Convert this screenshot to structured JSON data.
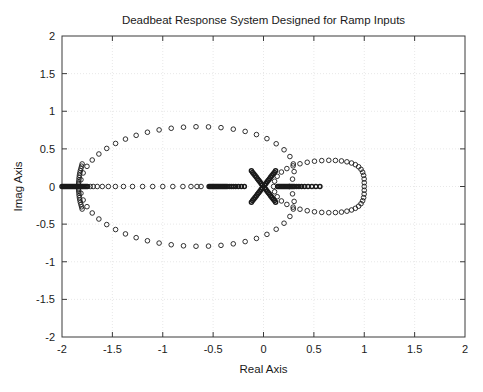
{
  "figure": {
    "title": "Deadbeat Response System Designed for Ramp Inputs",
    "background_color": "#ffffff",
    "axes_color": "#3a3a3a",
    "grid_color": "#e2e2e2",
    "marker_color": "#1a1a1a",
    "text_color": "#1a1a1a"
  },
  "chart_data": {
    "type": "scatter",
    "title": "Deadbeat Response System Designed for Ramp Inputs",
    "xlabel": "Real Axis",
    "ylabel": "Imag Axis",
    "xlim": [
      -2,
      2
    ],
    "ylim": [
      -2,
      2
    ],
    "grid": true,
    "legend": "none",
    "marker": "open-circle",
    "xticks": [
      -2,
      -1.5,
      -1,
      -0.5,
      0,
      0.5,
      1,
      1.5,
      2
    ],
    "yticks": [
      -2,
      -1.5,
      -1,
      -0.5,
      0,
      0.5,
      1,
      1.5,
      2
    ],
    "xtick_labels": [
      "-2",
      "-1.5",
      "-1",
      "-0.5",
      "0",
      "0.5",
      "1",
      "1.5",
      "2"
    ],
    "ytick_labels": [
      "-2",
      "-1.5",
      "-1",
      "-0.5",
      "0",
      "0.5",
      "1",
      "1.5",
      "2"
    ],
    "series": [
      {
        "name": "large-oval-branch",
        "comment": "Big closed oval from Real -1.82 to +0.30, max |Imag| ~ 0.80",
        "points": [
          [
            -1.82,
            0.0
          ],
          [
            -1.812,
            0.09
          ],
          [
            -1.79,
            0.18
          ],
          [
            -1.752,
            0.268
          ],
          [
            -1.7,
            0.352
          ],
          [
            -1.634,
            0.432
          ],
          [
            -1.556,
            0.506
          ],
          [
            -1.468,
            0.572
          ],
          [
            -1.37,
            0.63
          ],
          [
            -1.264,
            0.68
          ],
          [
            -1.152,
            0.721
          ],
          [
            -1.036,
            0.752
          ],
          [
            -0.916,
            0.774
          ],
          [
            -0.794,
            0.788
          ],
          [
            -0.67,
            0.794
          ],
          [
            -0.546,
            0.792
          ],
          [
            -0.422,
            0.782
          ],
          [
            -0.3,
            0.762
          ],
          [
            -0.182,
            0.732
          ],
          [
            -0.07,
            0.69
          ],
          [
            0.034,
            0.636
          ],
          [
            0.126,
            0.568
          ],
          [
            0.204,
            0.488
          ],
          [
            0.262,
            0.398
          ],
          [
            0.296,
            0.3
          ],
          [
            0.304,
            0.198
          ],
          [
            0.288,
            0.098
          ],
          [
            0.256,
            0.0
          ],
          [
            0.288,
            -0.098
          ],
          [
            0.304,
            -0.198
          ],
          [
            0.296,
            -0.3
          ],
          [
            0.262,
            -0.398
          ],
          [
            0.204,
            -0.488
          ],
          [
            0.126,
            -0.568
          ],
          [
            0.034,
            -0.636
          ],
          [
            -0.07,
            -0.69
          ],
          [
            -0.182,
            -0.732
          ],
          [
            -0.3,
            -0.762
          ],
          [
            -0.422,
            -0.782
          ],
          [
            -0.546,
            -0.792
          ],
          [
            -0.67,
            -0.794
          ],
          [
            -0.794,
            -0.788
          ],
          [
            -0.916,
            -0.774
          ],
          [
            -1.036,
            -0.752
          ],
          [
            -1.152,
            -0.721
          ],
          [
            -1.264,
            -0.68
          ],
          [
            -1.37,
            -0.63
          ],
          [
            -1.468,
            -0.572
          ],
          [
            -1.556,
            -0.506
          ],
          [
            -1.634,
            -0.432
          ],
          [
            -1.7,
            -0.352
          ],
          [
            -1.752,
            -0.268
          ],
          [
            -1.79,
            -0.18
          ],
          [
            -1.812,
            -0.09
          ]
        ]
      },
      {
        "name": "right-oval-branch",
        "comment": "Smaller oval from Real +0.10 to +1.00, max |Imag| ~ 0.36",
        "points": [
          [
            0.1,
            0.0
          ],
          [
            0.11,
            0.07
          ],
          [
            0.136,
            0.136
          ],
          [
            0.178,
            0.192
          ],
          [
            0.232,
            0.238
          ],
          [
            0.294,
            0.274
          ],
          [
            0.362,
            0.302
          ],
          [
            0.434,
            0.322
          ],
          [
            0.506,
            0.336
          ],
          [
            0.578,
            0.344
          ],
          [
            0.648,
            0.348
          ],
          [
            0.714,
            0.346
          ],
          [
            0.774,
            0.34
          ],
          [
            0.828,
            0.328
          ],
          [
            0.874,
            0.312
          ],
          [
            0.912,
            0.29
          ],
          [
            0.944,
            0.262
          ],
          [
            0.968,
            0.228
          ],
          [
            0.984,
            0.19
          ],
          [
            0.994,
            0.148
          ],
          [
            0.999,
            0.1
          ],
          [
            1.0,
            0.05
          ],
          [
            1.0,
            0.0
          ],
          [
            1.0,
            -0.05
          ],
          [
            0.999,
            -0.1
          ],
          [
            0.994,
            -0.148
          ],
          [
            0.984,
            -0.19
          ],
          [
            0.968,
            -0.228
          ],
          [
            0.944,
            -0.262
          ],
          [
            0.912,
            -0.29
          ],
          [
            0.874,
            -0.312
          ],
          [
            0.828,
            -0.328
          ],
          [
            0.774,
            -0.34
          ],
          [
            0.714,
            -0.346
          ],
          [
            0.648,
            -0.348
          ],
          [
            0.578,
            -0.344
          ],
          [
            0.506,
            -0.336
          ],
          [
            0.434,
            -0.322
          ],
          [
            0.362,
            -0.302
          ],
          [
            0.294,
            -0.274
          ],
          [
            0.232,
            -0.238
          ],
          [
            0.178,
            -0.192
          ],
          [
            0.136,
            -0.136
          ],
          [
            0.11,
            -0.07
          ]
        ]
      },
      {
        "name": "origin-star-rays",
        "comment": "Six dense rays emanating from the origin at 0, 60, 120, 180, 240, 300 degrees",
        "points": [
          [
            0.012,
            0.02
          ],
          [
            0.024,
            0.041
          ],
          [
            0.036,
            0.062
          ],
          [
            0.048,
            0.083
          ],
          [
            0.06,
            0.104
          ],
          [
            0.072,
            0.125
          ],
          [
            0.084,
            0.145
          ],
          [
            0.096,
            0.166
          ],
          [
            0.108,
            0.187
          ],
          [
            0.12,
            0.208
          ],
          [
            -0.012,
            0.02
          ],
          [
            -0.024,
            0.041
          ],
          [
            -0.036,
            0.062
          ],
          [
            -0.048,
            0.083
          ],
          [
            -0.06,
            0.104
          ],
          [
            -0.072,
            0.125
          ],
          [
            -0.084,
            0.145
          ],
          [
            -0.096,
            0.166
          ],
          [
            -0.108,
            0.187
          ],
          [
            -0.12,
            0.208
          ],
          [
            0.012,
            -0.02
          ],
          [
            0.024,
            -0.041
          ],
          [
            0.036,
            -0.062
          ],
          [
            0.048,
            -0.083
          ],
          [
            0.06,
            -0.104
          ],
          [
            0.072,
            -0.125
          ],
          [
            0.084,
            -0.145
          ],
          [
            0.096,
            -0.166
          ],
          [
            0.108,
            -0.187
          ],
          [
            0.12,
            -0.208
          ],
          [
            -0.012,
            -0.02
          ],
          [
            -0.024,
            -0.041
          ],
          [
            -0.036,
            -0.062
          ],
          [
            -0.048,
            -0.083
          ],
          [
            -0.06,
            -0.104
          ],
          [
            -0.072,
            -0.125
          ],
          [
            -0.084,
            -0.145
          ],
          [
            -0.096,
            -0.166
          ],
          [
            -0.108,
            -0.187
          ],
          [
            -0.12,
            -0.208
          ]
        ]
      },
      {
        "name": "left-vertical-arc",
        "comment": "Vertical arc centred near Real -1.80, Imag -0.30 to +0.30",
        "points": [
          [
            -1.8,
            0.3
          ],
          [
            -1.806,
            0.27
          ],
          [
            -1.812,
            0.24
          ],
          [
            -1.818,
            0.21
          ],
          [
            -1.823,
            0.18
          ],
          [
            -1.827,
            0.15
          ],
          [
            -1.83,
            0.12
          ],
          [
            -1.832,
            0.09
          ],
          [
            -1.834,
            0.06
          ],
          [
            -1.835,
            0.03
          ],
          [
            -1.835,
            0.0
          ],
          [
            -1.835,
            -0.03
          ],
          [
            -1.834,
            -0.06
          ],
          [
            -1.832,
            -0.09
          ],
          [
            -1.83,
            -0.12
          ],
          [
            -1.827,
            -0.15
          ],
          [
            -1.823,
            -0.18
          ],
          [
            -1.818,
            -0.21
          ],
          [
            -1.812,
            -0.24
          ],
          [
            -1.806,
            -0.27
          ],
          [
            -1.8,
            -0.3
          ]
        ]
      },
      {
        "name": "real-axis-left-dense",
        "comment": "Dense cluster on the real axis from -2.00 to -1.74",
        "points": [
          [
            -2.0,
            0.0
          ],
          [
            -1.988,
            0.0
          ],
          [
            -1.976,
            0.0
          ],
          [
            -1.964,
            0.0
          ],
          [
            -1.952,
            0.0
          ],
          [
            -1.94,
            0.0
          ],
          [
            -1.928,
            0.0
          ],
          [
            -1.916,
            0.0
          ],
          [
            -1.904,
            0.0
          ],
          [
            -1.892,
            0.0
          ],
          [
            -1.88,
            0.0
          ],
          [
            -1.868,
            0.0
          ],
          [
            -1.856,
            0.0
          ],
          [
            -1.844,
            0.0
          ],
          [
            -1.832,
            0.0
          ],
          [
            -1.82,
            0.0
          ],
          [
            -1.808,
            0.0
          ],
          [
            -1.796,
            0.0
          ],
          [
            -1.784,
            0.0
          ],
          [
            -1.772,
            0.0
          ],
          [
            -1.76,
            0.0
          ],
          [
            -1.748,
            0.0
          ]
        ]
      },
      {
        "name": "real-axis-left-sparse",
        "comment": "Sparse markers on the real axis between -1.72 and -1.10",
        "points": [
          [
            -1.72,
            0.0
          ],
          [
            -1.69,
            0.0
          ],
          [
            -1.65,
            0.0
          ],
          [
            -1.6,
            0.0
          ],
          [
            -1.54,
            0.0
          ],
          [
            -1.47,
            0.0
          ],
          [
            -1.39,
            0.0
          ],
          [
            -1.3,
            0.0
          ],
          [
            -1.2,
            0.0
          ],
          [
            -1.1,
            0.0
          ]
        ]
      },
      {
        "name": "real-axis-mid-sparse",
        "comment": "Widely spaced real-axis markers from -1.00 to -0.62",
        "points": [
          [
            -1.0,
            0.0
          ],
          [
            -0.9,
            0.0
          ],
          [
            -0.8,
            0.0
          ],
          [
            -0.72,
            0.0
          ],
          [
            -0.66,
            0.0
          ],
          [
            -0.62,
            0.0
          ]
        ]
      },
      {
        "name": "real-axis-center-dense",
        "comment": "Dense real-axis segment from -0.54 to -0.18 leading into the origin star",
        "points": [
          [
            -0.54,
            0.0
          ],
          [
            -0.528,
            0.0
          ],
          [
            -0.516,
            0.0
          ],
          [
            -0.504,
            0.0
          ],
          [
            -0.492,
            0.0
          ],
          [
            -0.48,
            0.0
          ],
          [
            -0.468,
            0.0
          ],
          [
            -0.456,
            0.0
          ],
          [
            -0.444,
            0.0
          ],
          [
            -0.432,
            0.0
          ],
          [
            -0.42,
            0.0
          ],
          [
            -0.408,
            0.0
          ],
          [
            -0.396,
            0.0
          ],
          [
            -0.384,
            0.0
          ],
          [
            -0.372,
            0.0
          ],
          [
            -0.36,
            0.0
          ],
          [
            -0.34,
            0.0
          ],
          [
            -0.32,
            0.0
          ],
          [
            -0.3,
            0.0
          ],
          [
            -0.276,
            0.0
          ],
          [
            -0.25,
            0.0
          ],
          [
            -0.22,
            0.0
          ],
          [
            -0.19,
            0.0
          ]
        ]
      },
      {
        "name": "real-axis-right-dense",
        "comment": "Dense real-axis segment from +0.14 to +0.56",
        "points": [
          [
            0.14,
            0.0
          ],
          [
            0.152,
            0.0
          ],
          [
            0.164,
            0.0
          ],
          [
            0.176,
            0.0
          ],
          [
            0.188,
            0.0
          ],
          [
            0.2,
            0.0
          ],
          [
            0.212,
            0.0
          ],
          [
            0.224,
            0.0
          ],
          [
            0.236,
            0.0
          ],
          [
            0.248,
            0.0
          ],
          [
            0.26,
            0.0
          ],
          [
            0.272,
            0.0
          ],
          [
            0.284,
            0.0
          ],
          [
            0.296,
            0.0
          ],
          [
            0.31,
            0.0
          ],
          [
            0.33,
            0.0
          ],
          [
            0.352,
            0.0
          ],
          [
            0.378,
            0.0
          ],
          [
            0.408,
            0.0
          ],
          [
            0.442,
            0.0
          ],
          [
            0.48,
            0.0
          ],
          [
            0.52,
            0.0
          ],
          [
            0.56,
            0.0
          ]
        ]
      }
    ]
  }
}
